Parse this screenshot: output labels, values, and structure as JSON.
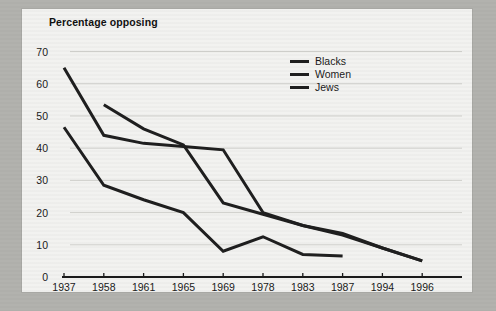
{
  "chart_data": {
    "type": "line",
    "title": "Percentage opposing",
    "subtitle": "",
    "xlabel": "",
    "ylabel": "",
    "categories": [
      "1937",
      "1958",
      "1961",
      "1965",
      "1969",
      "1978",
      "1983",
      "1987",
      "1994",
      "1996"
    ],
    "ylim": [
      0,
      70
    ],
    "yticks": [
      0,
      10,
      20,
      30,
      40,
      50,
      60,
      70
    ],
    "grid": true,
    "legend_position": "top-right",
    "series": [
      {
        "name": "Blacks",
        "color": "#1f1f1f",
        "values": [
          65,
          44,
          41.5,
          40.5,
          39.5,
          20,
          16,
          13,
          9,
          5
        ]
      },
      {
        "name": "Women",
        "color": "#1f1f1f",
        "values": [
          null,
          53.5,
          46,
          41,
          23,
          19.5,
          16,
          13.5,
          9,
          5
        ]
      },
      {
        "name": "Jews",
        "color": "#1f1f1f",
        "values": [
          46.5,
          28.5,
          24,
          20,
          8,
          12.5,
          7,
          6.5,
          null,
          null
        ]
      }
    ]
  },
  "panel": {
    "background": "#f2f2f0",
    "border": "#a0a09c",
    "axis_color": "#1a1a1a",
    "grid_color": "#cfcfcb"
  },
  "legend": {
    "entries": [
      "Blacks",
      "Women",
      "Jews"
    ]
  }
}
